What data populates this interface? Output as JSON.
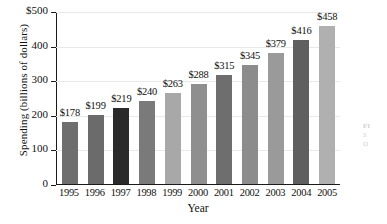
{
  "chart_data": {
    "type": "bar",
    "title": "",
    "xlabel": "Year",
    "ylabel": "Spending (billions of dollars)",
    "categories": [
      "1995",
      "1996",
      "1997",
      "1998",
      "1999",
      "2000",
      "2001",
      "2002",
      "2003",
      "2004",
      "2005"
    ],
    "values": [
      178,
      199,
      219,
      240,
      263,
      288,
      315,
      345,
      379,
      416,
      458
    ],
    "value_labels": [
      "$178",
      "$199",
      "$219",
      "$240",
      "$263",
      "$288",
      "$315",
      "$345",
      "$379",
      "$416",
      "$458"
    ],
    "ylim": [
      0,
      500
    ],
    "yticks": [
      0,
      100,
      200,
      300,
      400,
      500
    ],
    "ytick_labels": [
      "0",
      "100",
      "200",
      "300",
      "400",
      "$500"
    ],
    "grid": true,
    "legend": "none",
    "bar_colors": [
      "#6e6e6e",
      "#6b6b6b",
      "#2a2a2a",
      "#7a7a7a",
      "#a8a8a8",
      "#8f8f8f",
      "#6e6e6e",
      "#8c8c8c",
      "#9a9a9a",
      "#5f5f5f",
      "#b0b0b0"
    ]
  },
  "caption": {
    "figure_label": "FI",
    "source_line": "S",
    "org_line": "O"
  }
}
